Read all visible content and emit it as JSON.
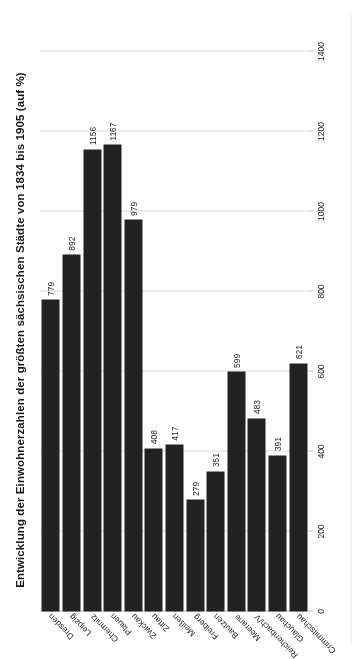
{
  "chart_data": {
    "type": "bar",
    "orientation": "horizontal",
    "title": "Entwicklung der Einwohnerzahlen der größten sächsischen Städte von 1834 bis 1905 (auf %)",
    "subtitle": "",
    "xlabel": "",
    "ylabel": "",
    "categories": [
      "Dresden",
      "Leipzig",
      "Chemnitz",
      "Plauen",
      "Zwickau",
      "Zittau",
      "Meißen",
      "Freiberg",
      "Bautzen",
      "Meerane",
      "Reichenbach/V",
      "Glauchau",
      "Crimmitschau"
    ],
    "values": [
      779,
      892,
      1156,
      1167,
      979,
      408,
      417,
      279,
      351,
      599,
      483,
      391,
      621
    ],
    "value_labels": [
      "779",
      "892",
      "1156",
      "1167",
      "979",
      "408",
      "417",
      "279",
      "351",
      "599",
      "483",
      "391",
      "621"
    ],
    "xlim": [
      0,
      1400
    ],
    "ticks": [
      0,
      200,
      400,
      600,
      800,
      1000,
      1200,
      1400
    ],
    "tick_labels": [
      "0",
      "200",
      "400",
      "600",
      "800",
      "1000",
      "1200",
      "1400"
    ],
    "grid": true,
    "legend": "none",
    "bar_color": "#262626",
    "gridline_color": "#d6d6d6",
    "text_color": "#2b2b2b",
    "background": "#ffffff"
  }
}
